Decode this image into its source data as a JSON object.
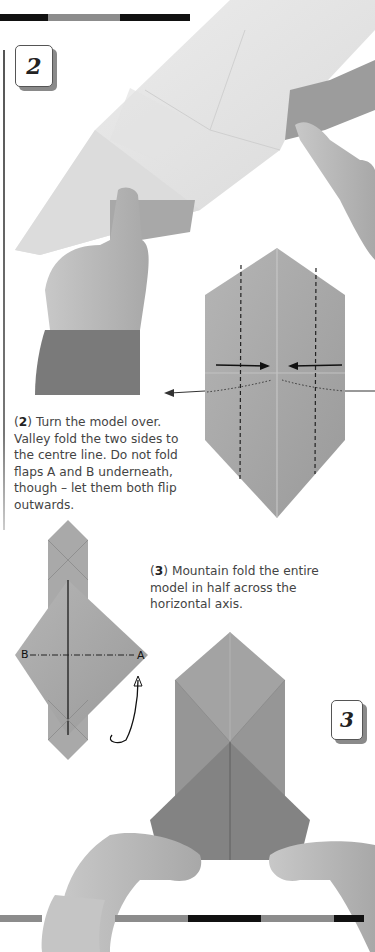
{
  "page": {
    "step2": {
      "badge": "2",
      "caption_num": "2",
      "caption_text": " Turn the model over. Valley fold the two sides to the centre line. Do not fold flaps A and B underneath, though – let them both flip outwards."
    },
    "step3": {
      "badge": "3",
      "caption_num": "3",
      "caption_text": " Mountain fold the entire model in half across the horizontal axis."
    },
    "diagram_labels": {
      "flap_a": "A",
      "flap_b": "B"
    },
    "colors": {
      "paper_light": "#e6e6e6",
      "paper_mid": "#a8a8a8",
      "paper_dark": "#858585",
      "skin": "#bdbdbd",
      "sleeve": "#7a7a7a",
      "bar_black": "#111111",
      "bar_grey": "#8c8c8c"
    }
  }
}
